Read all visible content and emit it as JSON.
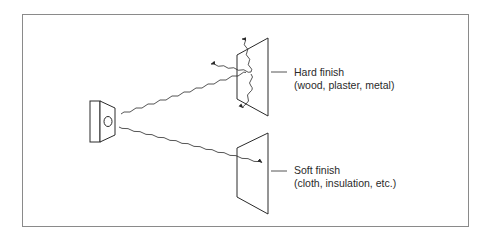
{
  "diagram": {
    "source": {
      "name": "Loudspeaker"
    },
    "surfaces": [
      {
        "id": "hard",
        "title": "Hard finish",
        "examples": "(wood, plaster, metal)",
        "behavior": "reflects"
      },
      {
        "id": "soft",
        "title": "Soft finish",
        "examples": "(cloth, insulation, etc.)",
        "behavior": "absorbs"
      }
    ],
    "colors": {
      "line": "#2a2a2a",
      "frame": "#8a8a8a",
      "background": "#ffffff"
    }
  }
}
